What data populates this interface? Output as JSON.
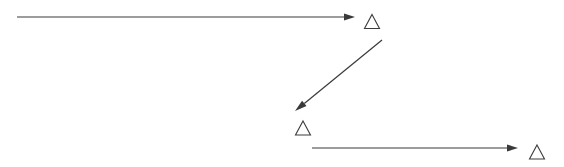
{
  "canvas": {
    "width": 564,
    "height": 167,
    "background_color": "#ffffff"
  },
  "style": {
    "arrow_color": "#3a3a3a",
    "arrow_stroke_width": 1.2,
    "triangle_color": "#3d3d3d",
    "triangle_stroke_width": 1.1
  },
  "diagram": {
    "type": "flow-arrows",
    "arrows": [
      {
        "id": "arrow-top",
        "name": "top-horizontal-arrow",
        "direction": "right",
        "x1": 17,
        "y1": 17,
        "x2": 355,
        "y2": 17,
        "head_length": 11,
        "head_width": 7
      },
      {
        "id": "arrow-diagonal",
        "name": "diagonal-down-left-arrow",
        "direction": "down-left",
        "x1": 382,
        "y1": 40,
        "x2": 295,
        "y2": 111,
        "head_length": 12,
        "head_width": 7
      },
      {
        "id": "arrow-bottom",
        "name": "bottom-horizontal-arrow",
        "direction": "right",
        "x1": 312,
        "y1": 148,
        "x2": 518,
        "y2": 148,
        "head_length": 11,
        "head_width": 7
      }
    ],
    "triangles": [
      {
        "id": "triangle-1",
        "name": "triangle-marker-top",
        "cx": 372,
        "cy": 21.5,
        "width": 15,
        "height": 14
      },
      {
        "id": "triangle-2",
        "name": "triangle-marker-middle",
        "cx": 303,
        "cy": 128,
        "width": 15,
        "height": 14
      },
      {
        "id": "triangle-3",
        "name": "triangle-marker-bottom",
        "cx": 537,
        "cy": 152,
        "width": 15,
        "height": 14
      }
    ]
  }
}
